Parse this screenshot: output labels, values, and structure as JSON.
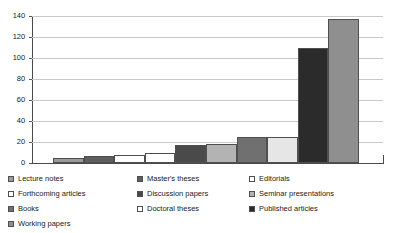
{
  "chart_data": {
    "type": "bar",
    "title": "",
    "xlabel": "",
    "ylabel": "",
    "ylim": [
      0,
      140
    ],
    "grid": true,
    "legend_position": "bottom",
    "yticks": [
      0,
      20,
      40,
      60,
      80,
      100,
      120,
      140
    ],
    "categories": [
      "Lecture notes",
      "Master's theses",
      "Editorials",
      "Forthcoming articles",
      "Discussion papers",
      "Seminar presentations",
      "Books",
      "Doctoral theses",
      "Published articles",
      "Working papers"
    ],
    "values": [
      5,
      7,
      8,
      10,
      17,
      18,
      25,
      25,
      110,
      137
    ],
    "colors": [
      "#9a9a9a",
      "#5e5e5e",
      "#ffffff",
      "#ffffff",
      "#4a4a4a",
      "#b3b3b3",
      "#707070",
      "#e6e6e6",
      "#2b2b2b",
      "#8f8f8f"
    ]
  },
  "legend": {
    "columns": [
      [
        {
          "label": "Lecture notes",
          "color": "#9a9a9a"
        },
        {
          "label": "Forthcoming articles",
          "color": "#ffffff"
        },
        {
          "label": "Books",
          "color": "#707070"
        },
        {
          "label": "Working papers",
          "color": "#8f8f8f"
        }
      ],
      [
        {
          "label": "Master's theses",
          "color": "#5e5e5e"
        },
        {
          "label": "Discussion papers",
          "color": "#4a4a4a"
        },
        {
          "label": "Doctoral theses",
          "color": "#ffffff"
        }
      ],
      [
        {
          "label": "Editorials",
          "color": "#ffffff"
        },
        {
          "label": "Seminar presentations",
          "color": "#b3b3b3"
        },
        {
          "label": "Published articles",
          "color": "#2b2b2b"
        }
      ]
    ]
  }
}
